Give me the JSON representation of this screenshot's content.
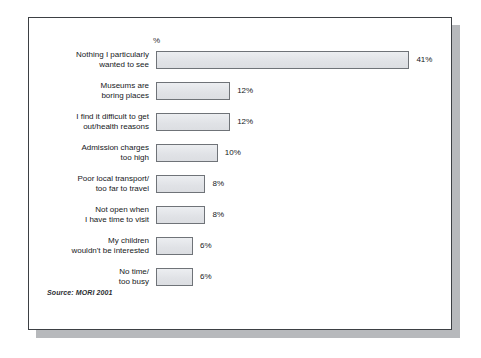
{
  "chart_data": {
    "type": "bar",
    "orientation": "horizontal",
    "title": "",
    "subtitle": "",
    "xlabel": "%",
    "ylabel": "",
    "axis_unit_label": "%",
    "grid": false,
    "legend": null,
    "xlim": [
      0,
      41
    ],
    "categories": [
      "Nothing I particularly\nwanted to see",
      "Museums are\nboring places",
      "I find it difficult to get\nout/health reasons",
      "Admission charges\ntoo high",
      "Poor local transport/\ntoo far to travel",
      "Not open when\nI have time to visit",
      "My children\nwouldn't be interested",
      "No time/\ntoo busy"
    ],
    "values": [
      41,
      12,
      12,
      10,
      8,
      8,
      6,
      6
    ],
    "value_labels": [
      "41%",
      "12%",
      "12%",
      "10%",
      "8%",
      "8%",
      "6%",
      "6%"
    ],
    "bars": [
      {
        "label": "Nothing I particularly\nwanted to see",
        "value": 41,
        "value_label": "41%"
      },
      {
        "label": "Museums are\nboring places",
        "value": 12,
        "value_label": "12%"
      },
      {
        "label": "I find it difficult to get\nout/health reasons",
        "value": 12,
        "value_label": "12%"
      },
      {
        "label": "Admission charges\ntoo high",
        "value": 10,
        "value_label": "10%"
      },
      {
        "label": "Poor local transport/\ntoo far to travel",
        "value": 8,
        "value_label": "8%"
      },
      {
        "label": "Not open when\nI have time to visit",
        "value": 8,
        "value_label": "8%"
      },
      {
        "label": "My children\nwouldn't be interested",
        "value": 6,
        "value_label": "6%"
      },
      {
        "label": "No time/\ntoo busy",
        "value": 6,
        "value_label": "6%"
      }
    ],
    "annotations": [
      "Source: MORI 2001"
    ]
  },
  "source_note": "Source: MORI 2001",
  "colors": {
    "bar_fill": "#e3e5e9",
    "bar_border": "#6f7378",
    "frame_border": "#3d4044",
    "frame_shadow": "#b7b9bc",
    "text": "#16181b",
    "background": "#ffffff"
  }
}
